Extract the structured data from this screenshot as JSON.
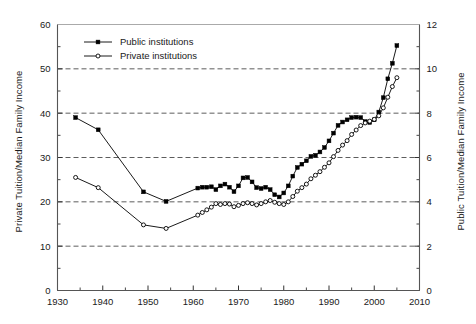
{
  "chart_data": {
    "type": "line",
    "title": "",
    "xlabel": "",
    "ylabel": "Private Tuition/Median Family Income",
    "y2label": "Public Tuition/Median Family Income",
    "xlim": [
      1930,
      2010
    ],
    "ylim": [
      0,
      60
    ],
    "y2lim": [
      0,
      12
    ],
    "xticks": [
      1930,
      1940,
      1950,
      1960,
      1970,
      1980,
      1990,
      2000,
      2010
    ],
    "xticklabels": [
      "1930",
      "1940",
      "1950",
      "1960",
      "1970",
      "1980",
      "1990",
      "2000",
      "2010"
    ],
    "yticks": [
      0,
      10,
      20,
      30,
      40,
      50,
      60
    ],
    "yticklabels": [
      "0",
      "10",
      "20",
      "30",
      "40",
      "50",
      "60"
    ],
    "y2ticks": [
      0,
      2,
      4,
      6,
      8,
      10,
      12
    ],
    "y2ticklabels": [
      "0",
      "2",
      "4",
      "6",
      "8",
      "10",
      "12"
    ],
    "yminorticks": [
      5,
      15,
      25,
      35,
      45,
      55
    ],
    "y2minorticks": [
      1,
      3,
      5,
      7,
      9,
      11
    ],
    "xminorticks": [
      1935,
      1945,
      1955,
      1965,
      1975,
      1985,
      1995,
      2005
    ],
    "grid": "horizontal-dashed",
    "gridvalues": [
      10,
      20,
      30,
      40,
      50
    ],
    "legend_position": "top-left-inside",
    "series": [
      {
        "name": "Public institutions",
        "axis": "right",
        "marker": "filled-square",
        "color": "#000000",
        "points": [
          [
            1934,
            7.8
          ],
          [
            1939,
            7.25
          ],
          [
            1949,
            4.45
          ],
          [
            1954,
            4.02
          ],
          [
            1961,
            4.62
          ],
          [
            1962,
            4.66
          ],
          [
            1963,
            4.66
          ],
          [
            1964,
            4.68
          ],
          [
            1965,
            4.55
          ],
          [
            1966,
            4.72
          ],
          [
            1967,
            4.8
          ],
          [
            1968,
            4.66
          ],
          [
            1969,
            4.46
          ],
          [
            1970,
            4.72
          ],
          [
            1971,
            5.08
          ],
          [
            1972,
            5.1
          ],
          [
            1973,
            4.9
          ],
          [
            1974,
            4.64
          ],
          [
            1975,
            4.6
          ],
          [
            1976,
            4.66
          ],
          [
            1977,
            4.55
          ],
          [
            1978,
            4.32
          ],
          [
            1979,
            4.22
          ],
          [
            1980,
            4.4
          ],
          [
            1981,
            4.72
          ],
          [
            1982,
            5.16
          ],
          [
            1983,
            5.55
          ],
          [
            1984,
            5.7
          ],
          [
            1985,
            5.85
          ],
          [
            1986,
            6.05
          ],
          [
            1987,
            6.1
          ],
          [
            1988,
            6.25
          ],
          [
            1989,
            6.45
          ],
          [
            1990,
            6.75
          ],
          [
            1991,
            7.1
          ],
          [
            1992,
            7.45
          ],
          [
            1993,
            7.6
          ],
          [
            1994,
            7.7
          ],
          [
            1995,
            7.8
          ],
          [
            1996,
            7.82
          ],
          [
            1997,
            7.8
          ],
          [
            1998,
            7.62
          ],
          [
            1999,
            7.58
          ],
          [
            2000,
            7.7
          ],
          [
            2001,
            8.05
          ],
          [
            2002,
            8.7
          ],
          [
            2003,
            9.55
          ],
          [
            2004,
            10.25
          ],
          [
            2005,
            11.05
          ]
        ]
      },
      {
        "name": "Private institutions",
        "axis": "left",
        "marker": "open-circle",
        "color": "#000000",
        "points": [
          [
            1934,
            25.5
          ],
          [
            1939,
            23.2
          ],
          [
            1949,
            14.8
          ],
          [
            1954,
            14.0
          ],
          [
            1961,
            17.0
          ],
          [
            1962,
            17.6
          ],
          [
            1963,
            18.2
          ],
          [
            1964,
            18.8
          ],
          [
            1965,
            19.6
          ],
          [
            1966,
            19.4
          ],
          [
            1967,
            19.6
          ],
          [
            1968,
            19.5
          ],
          [
            1969,
            18.9
          ],
          [
            1970,
            19.2
          ],
          [
            1971,
            19.6
          ],
          [
            1972,
            19.8
          ],
          [
            1973,
            19.6
          ],
          [
            1974,
            19.3
          ],
          [
            1975,
            19.6
          ],
          [
            1976,
            20.0
          ],
          [
            1977,
            20.3
          ],
          [
            1978,
            19.9
          ],
          [
            1979,
            19.6
          ],
          [
            1980,
            19.4
          ],
          [
            1981,
            20.0
          ],
          [
            1982,
            21.2
          ],
          [
            1983,
            22.4
          ],
          [
            1984,
            23.2
          ],
          [
            1985,
            24.0
          ],
          [
            1986,
            25.2
          ],
          [
            1987,
            26.0
          ],
          [
            1988,
            26.8
          ],
          [
            1989,
            27.8
          ],
          [
            1990,
            28.8
          ],
          [
            1991,
            30.2
          ],
          [
            1992,
            31.6
          ],
          [
            1993,
            32.8
          ],
          [
            1994,
            33.8
          ],
          [
            1995,
            35.2
          ],
          [
            1996,
            36.2
          ],
          [
            1997,
            37.2
          ],
          [
            1998,
            37.8
          ],
          [
            1999,
            38.2
          ],
          [
            2000,
            38.6
          ],
          [
            2001,
            39.4
          ],
          [
            2002,
            41.2
          ],
          [
            2003,
            43.6
          ],
          [
            2004,
            46.0
          ],
          [
            2005,
            48.0
          ]
        ]
      }
    ],
    "legend": [
      {
        "label": "Public institutions",
        "marker": "filled-square"
      },
      {
        "label": "Private institutions",
        "marker": "open-circle"
      }
    ]
  }
}
